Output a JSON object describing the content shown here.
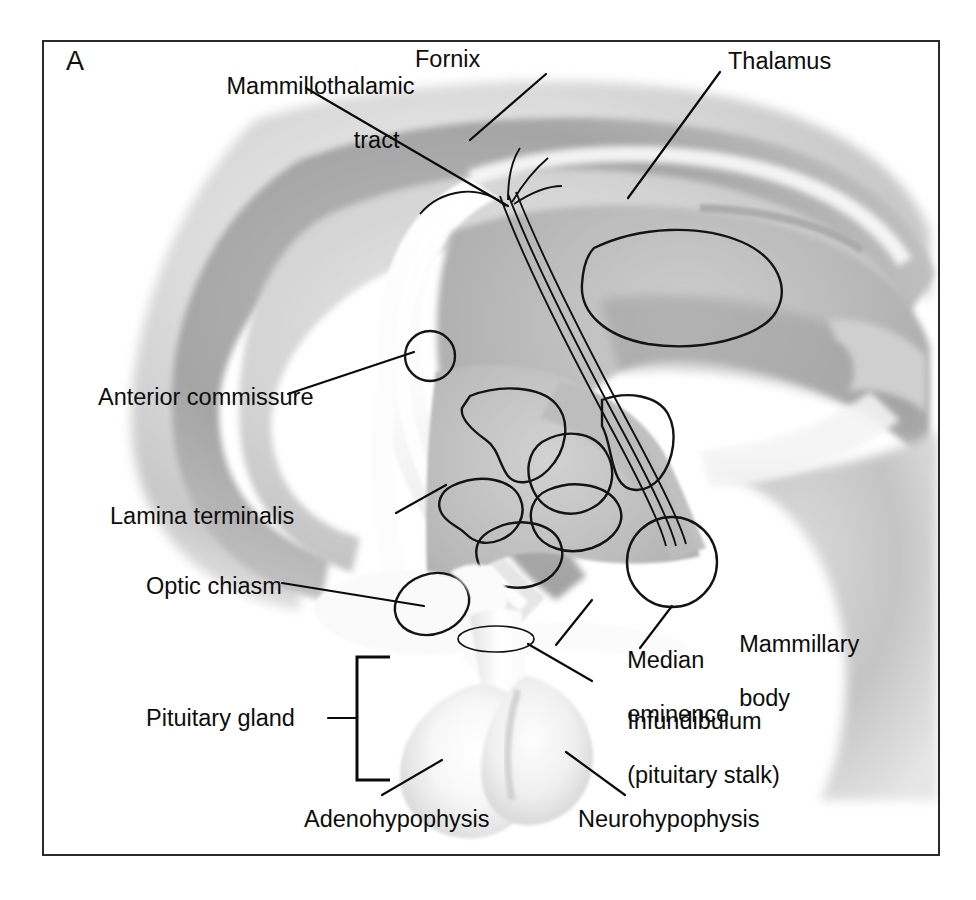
{
  "figure": {
    "panel_letter": "A",
    "frame_color": "#2a2a2a",
    "background_color": "#ffffff",
    "ink_color": "#0d0d0d"
  },
  "labels": {
    "mammillothalamic_tract_l1": "Mammillothalamic",
    "mammillothalamic_tract_l2": "tract",
    "fornix": "Fornix",
    "thalamus": "Thalamus",
    "anterior_commissure": "Anterior commissure",
    "lamina_terminalis": "Lamina terminalis",
    "optic_chiasm": "Optic chiasm",
    "pituitary_gland": "Pituitary gland",
    "median_eminence_l1": "Median",
    "median_eminence_l2": "eminence",
    "mammillary_body_l1": "Mammillary",
    "mammillary_body_l2": "body",
    "infundibulum_l1": "Infundibulum",
    "infundibulum_l2": "(pituitary stalk)",
    "adenohypophysis": "Adenohypophysis",
    "neurohypophysis": "Neurohypophysis"
  },
  "structures": [
    {
      "name": "cerebral-hemisphere-mass",
      "tone": "#d6d6d6"
    },
    {
      "name": "corpus-callosum",
      "tone": "#a8a8a8"
    },
    {
      "name": "fornix",
      "tone": "#fdfdfd"
    },
    {
      "name": "thalamus",
      "tone": "#b4b4b4"
    },
    {
      "name": "massa-intermedia",
      "tone": "#e4e4e4"
    },
    {
      "name": "hypothalamus",
      "tone": "#bcbcbc"
    },
    {
      "name": "hypothalamic-nuclei",
      "tone": "#c2c2c2"
    },
    {
      "name": "mammillary-body",
      "tone": "#b6b6b6"
    },
    {
      "name": "optic-chiasm",
      "tone": "#f7f7f7"
    },
    {
      "name": "anterior-commissure",
      "tone": "#f2f2f2"
    },
    {
      "name": "lamina-terminalis",
      "tone": "#fbfbfb"
    },
    {
      "name": "infundibulum",
      "tone": "#fafafa"
    },
    {
      "name": "adenohypophysis",
      "tone": "#f4f4f4"
    },
    {
      "name": "neurohypophysis",
      "tone": "#efefef"
    },
    {
      "name": "midbrain-brainstem",
      "tone": "#cdcdcd"
    }
  ]
}
